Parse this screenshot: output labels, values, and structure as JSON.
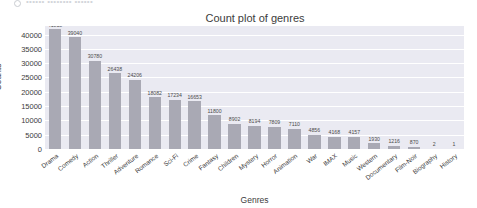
{
  "top_strip": {
    "icon": "circle-avatar-icon",
    "faint_text": "••••••  ••••••••  ••••••"
  },
  "chart_data": {
    "type": "bar",
    "title": "Count plot of genres",
    "xlabel": "Genres",
    "ylabel": "Counts",
    "ylim": [
      0,
      43000
    ],
    "grid": true,
    "legend": null,
    "yticks": [
      0,
      5000,
      10000,
      15000,
      20000,
      25000,
      30000,
      35000,
      40000
    ],
    "ytick_labels": [
      "0",
      "5000",
      "10000",
      "15000",
      "20000",
      "25000",
      "30000",
      "35000",
      "40000"
    ],
    "categories": [
      "Drama",
      "Comedy",
      "Action",
      "Thriller",
      "Adventure",
      "Romance",
      "Sci-Fi",
      "Crime",
      "Fantasy",
      "Children",
      "Mystery",
      "Horror",
      "Animation",
      "War",
      "IMAX",
      "Music",
      "Western",
      "Documentary",
      "Film-Noir",
      "Biography",
      "History"
    ],
    "values": [
      41818,
      39040,
      30780,
      26438,
      24206,
      18082,
      17234,
      16653,
      11800,
      8902,
      8194,
      7809,
      7110,
      4856,
      4168,
      4157,
      1930,
      1216,
      870,
      2,
      1
    ],
    "value_labels": [
      "41818",
      "39040",
      "30780",
      "26438",
      "24206",
      "18082",
      "17234",
      "16653",
      "11800",
      "8902",
      "8194",
      "7809",
      "7110",
      "4856",
      "4168",
      "4157",
      "1930",
      "1216",
      "870",
      "2",
      "1"
    ],
    "colors": {
      "bar": "#a9a9b4",
      "plot_background": "#eaeaf2",
      "gridline": "#ffffff",
      "text": "#3c3c3c",
      "figure_background": "#ffffff"
    }
  }
}
